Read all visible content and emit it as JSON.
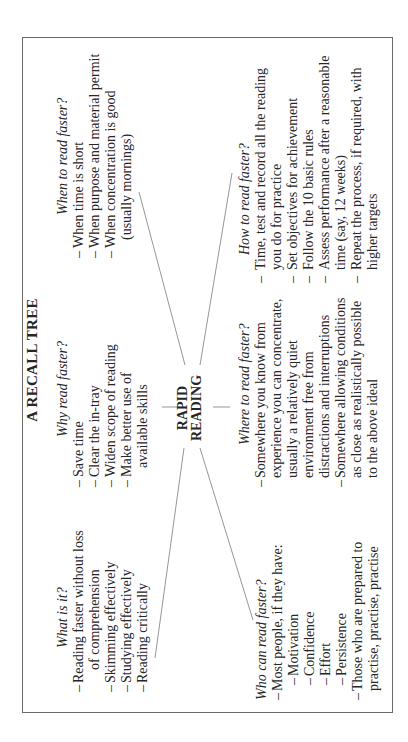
{
  "title": "A RECALL TREE",
  "center": {
    "line1": "RAPID",
    "line2": "READING"
  },
  "branches": {
    "what": {
      "heading": "What is it?",
      "items": [
        {
          "lines": [
            "Reading faster without loss",
            "of comprehension"
          ]
        },
        {
          "lines": [
            "Skimming effectively"
          ]
        },
        {
          "lines": [
            "Studying effectively"
          ]
        },
        {
          "lines": [
            "Reading critically"
          ]
        }
      ]
    },
    "why": {
      "heading": "Why read faster?",
      "items": [
        {
          "lines": [
            "Save time"
          ]
        },
        {
          "lines": [
            "Clear the in-tray"
          ]
        },
        {
          "lines": [
            "Widen scope of reading"
          ]
        },
        {
          "lines": [
            "Make better use of",
            "available skills"
          ]
        }
      ]
    },
    "when": {
      "heading": "When to read faster?",
      "items": [
        {
          "lines": [
            "When time is short"
          ]
        },
        {
          "lines": [
            "When purpose and material permit"
          ]
        },
        {
          "lines": [
            "When concentration is good",
            "(usually mornings)"
          ]
        }
      ]
    },
    "who": {
      "heading": "Who can read faster?",
      "items": [
        {
          "lines": [
            "Most people, if they have:"
          ]
        },
        {
          "lines": [
            "Motivation"
          ],
          "sub": true
        },
        {
          "lines": [
            "Confidence"
          ],
          "sub": true
        },
        {
          "lines": [
            "Effort"
          ],
          "sub": true
        },
        {
          "lines": [
            "Persistence"
          ],
          "sub": true
        },
        {
          "lines": [
            "Those who are prepared to",
            "practise, practise, practise"
          ]
        }
      ]
    },
    "where": {
      "heading": "Where to read faster?",
      "items": [
        {
          "lines": [
            "Somewhere you know from",
            "experience you can concentrate,",
            "usually a relatively quiet",
            "environment free from",
            "distractions and interruptions"
          ]
        },
        {
          "lines": [
            "Somewhere allowing conditions",
            "as close as realistically possible",
            "to the above ideal"
          ]
        }
      ]
    },
    "how": {
      "heading": "How to read faster?",
      "items": [
        {
          "lines": [
            "Time, test and record all the reading",
            "you do for practice"
          ]
        },
        {
          "lines": [
            "Set objectives for achievement"
          ]
        },
        {
          "lines": [
            "Follow the 10 basic rules"
          ]
        },
        {
          "lines": [
            "Assess performance after a reasonable",
            "time (say, 12 weeks)"
          ]
        },
        {
          "lines": [
            "Repeat the process, if required, with",
            "higher targets"
          ]
        }
      ]
    }
  },
  "dash": "–",
  "colors": {
    "text": "#262626",
    "border": "#6a6a6a",
    "lines": "#8a8a8a",
    "background": "#ffffff"
  }
}
